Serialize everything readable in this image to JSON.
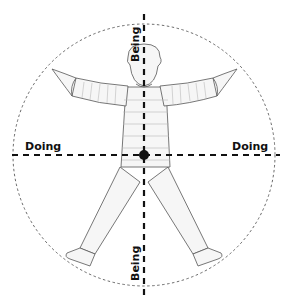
{
  "diagram": {
    "axes": {
      "vertical_label_top": "Being",
      "vertical_label_bottom": "Being",
      "horizontal_label_left": "Doing",
      "horizontal_label_right": "Doing"
    },
    "colors": {
      "stroke": "#111111",
      "figure_outline": "#555555",
      "figure_fill": "#f4f4f4",
      "stripe": "#bbbbbb",
      "circle": "#444444"
    }
  }
}
